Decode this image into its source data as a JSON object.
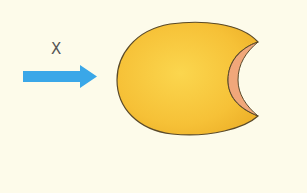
{
  "diagram": {
    "arrow": {
      "label": "X",
      "direction": "right",
      "color": "#3aa7e8"
    },
    "shape": {
      "description": "yellow ellipsoid body with concave crescent notch on right side",
      "fill": "#f6c53a",
      "notch_fill": "#f0a77a",
      "outline": "#5a4a2a"
    },
    "background": "#fdfbea"
  }
}
